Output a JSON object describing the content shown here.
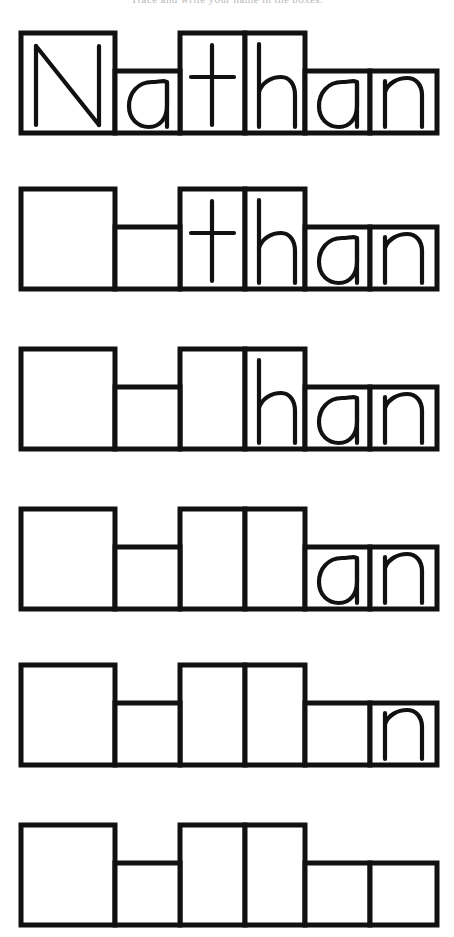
{
  "worksheet": {
    "header_text": "Trace and write your name in the boxes.",
    "name": "Nathan",
    "letters": [
      "N",
      "a",
      "t",
      "h",
      "a",
      "n"
    ],
    "ink_color": "#111111",
    "paper_color": "#ffffff",
    "box_count_per_row": 6,
    "row_count": 6,
    "letter_heights": [
      "tall",
      "short",
      "tall",
      "tall",
      "short",
      "short"
    ],
    "rows": [
      {
        "index": 1,
        "shown_letters": [
          "N",
          "a",
          "t",
          "h",
          "a",
          "n"
        ],
        "hidden_count": 0,
        "label": "Nathan"
      },
      {
        "index": 2,
        "shown_letters": [
          "",
          "",
          "t",
          "h",
          "a",
          "n"
        ],
        "hidden_count": 2,
        "label": "than"
      },
      {
        "index": 3,
        "shown_letters": [
          "",
          "",
          "",
          "h",
          "a",
          "n"
        ],
        "hidden_count": 3,
        "label": "han"
      },
      {
        "index": 4,
        "shown_letters": [
          "",
          "",
          "",
          "",
          "a",
          "n"
        ],
        "hidden_count": 4,
        "label": "an"
      },
      {
        "index": 5,
        "shown_letters": [
          "",
          "",
          "",
          "",
          "",
          "n"
        ],
        "hidden_count": 5,
        "label": "n"
      },
      {
        "index": 6,
        "shown_letters": [
          "",
          "",
          "",
          "",
          "",
          ""
        ],
        "hidden_count": 6,
        "label": ""
      }
    ]
  },
  "geometry": {
    "box_x_edges": [
      21,
      115,
      180,
      245,
      305,
      370,
      437
    ],
    "row_tops": [
      30,
      186,
      346,
      506,
      662,
      822
    ],
    "row_bottom_offset": 100,
    "tall_box_top": 0,
    "short_box_top": 38
  }
}
